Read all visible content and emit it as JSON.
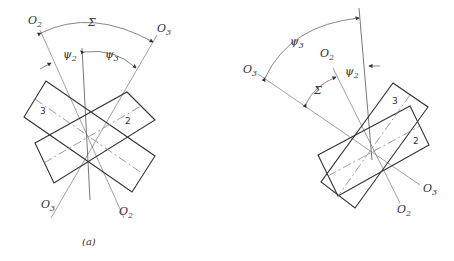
{
  "figure_a": {
    "caption": "(a)",
    "labels": {
      "o2_top": "O",
      "o2_top_sub": "2",
      "o3_top": "O",
      "o3_top_sub": "3",
      "sigma": "Σ",
      "psi2": "ψ",
      "psi2_sub": "2",
      "psi3": "ψ",
      "psi3_sub": "3",
      "o3_bottom": "O",
      "o3_bottom_sub": "3",
      "o2_bottom": "O",
      "o2_bottom_sub": "2"
    },
    "gears": {
      "left": "3",
      "right": "2"
    }
  },
  "figure_b": {
    "labels": {
      "psi3": "ψ",
      "psi3_sub": "3",
      "o2_top": "O",
      "o2_top_sub": "2",
      "psi2": "ψ",
      "psi2_sub": "2",
      "o3_left": "O",
      "o3_left_sub": "3",
      "sigma": "Σ",
      "o3_right": "O",
      "o3_right_sub": "3",
      "o2_bottom": "O",
      "o2_bottom_sub": "2"
    },
    "gears": {
      "upper": "3",
      "lower": "2"
    }
  }
}
